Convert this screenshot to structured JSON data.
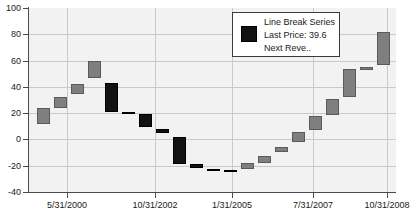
{
  "chart_data": {
    "type": "bar",
    "title": "",
    "subtitle": "",
    "xlabel": "",
    "ylabel": "",
    "ylim": [
      -40,
      100
    ],
    "ytick_values": [
      100,
      80,
      60,
      40,
      20,
      0,
      -20,
      -40
    ],
    "ytick_labels": [
      "100",
      "80",
      "60",
      "40",
      "20",
      "0",
      "-20",
      "-40"
    ],
    "xtick_labels": [
      "5/31/2000",
      "10/31/2002",
      "1/31/2005",
      "7/31/2007",
      "10/31/2008"
    ],
    "xtick_positions": [
      0.105,
      0.345,
      0.555,
      0.775,
      0.975
    ],
    "grid": true,
    "legend_position": "top-right",
    "colors": {
      "up": "#7f7f7f",
      "down": "#121212",
      "plot_background": "#f2f2f2",
      "grid": "#c9c9c9",
      "axis": "#4a4a4a",
      "text": "#1a1a1a",
      "legend_background": "#ffffff",
      "legend_border": "#3a3a3a"
    },
    "series_name": "Line Break Series",
    "bars": [
      {
        "index": 0,
        "open": 11.5,
        "close": 24.0,
        "direction": "up"
      },
      {
        "index": 1,
        "open": 24.0,
        "close": 32.6,
        "direction": "up"
      },
      {
        "index": 2,
        "open": 34.5,
        "close": 42.4,
        "direction": "up"
      },
      {
        "index": 3,
        "open": 46.5,
        "close": 59.5,
        "direction": "up"
      },
      {
        "index": 4,
        "open": 42.8,
        "close": 21.0,
        "direction": "down"
      },
      {
        "index": 5,
        "open": 21.0,
        "close": 20.0,
        "direction": "down"
      },
      {
        "index": 6,
        "open": 19.3,
        "close": 9.5,
        "direction": "down"
      },
      {
        "index": 7,
        "open": 8.0,
        "close": 4.6,
        "direction": "down"
      },
      {
        "index": 8,
        "open": 2.2,
        "close": -18.5,
        "direction": "down"
      },
      {
        "index": 9,
        "open": -19.0,
        "close": -21.8,
        "direction": "down"
      },
      {
        "index": 10,
        "open": -22.8,
        "close": -24.2,
        "direction": "down"
      },
      {
        "index": 11,
        "open": -23.6,
        "close": -24.3,
        "direction": "down"
      },
      {
        "index": 12,
        "open": -17.8,
        "close": -22.0,
        "direction": "up"
      },
      {
        "index": 13,
        "open": -12.6,
        "close": -17.6,
        "direction": "up"
      },
      {
        "index": 14,
        "open": -5.8,
        "close": -9.8,
        "direction": "up"
      },
      {
        "index": 15,
        "open": 5.9,
        "close": -1.5,
        "direction": "up"
      },
      {
        "index": 16,
        "open": 17.5,
        "close": 7.0,
        "direction": "up"
      },
      {
        "index": 17,
        "open": 30.8,
        "close": 18.6,
        "direction": "up"
      },
      {
        "index": 18,
        "open": 53.4,
        "close": 31.8,
        "direction": "up"
      },
      {
        "index": 19,
        "open": 55.4,
        "close": 53.4,
        "direction": "up"
      },
      {
        "index": 20,
        "open": 82.0,
        "close": 56.6,
        "direction": "up"
      }
    ]
  },
  "legend": {
    "series_label": "Line Break Series",
    "last_price_label": "Last Price: 39.6",
    "next_label": "Next Reve..",
    "swatch_color": "#121212"
  }
}
